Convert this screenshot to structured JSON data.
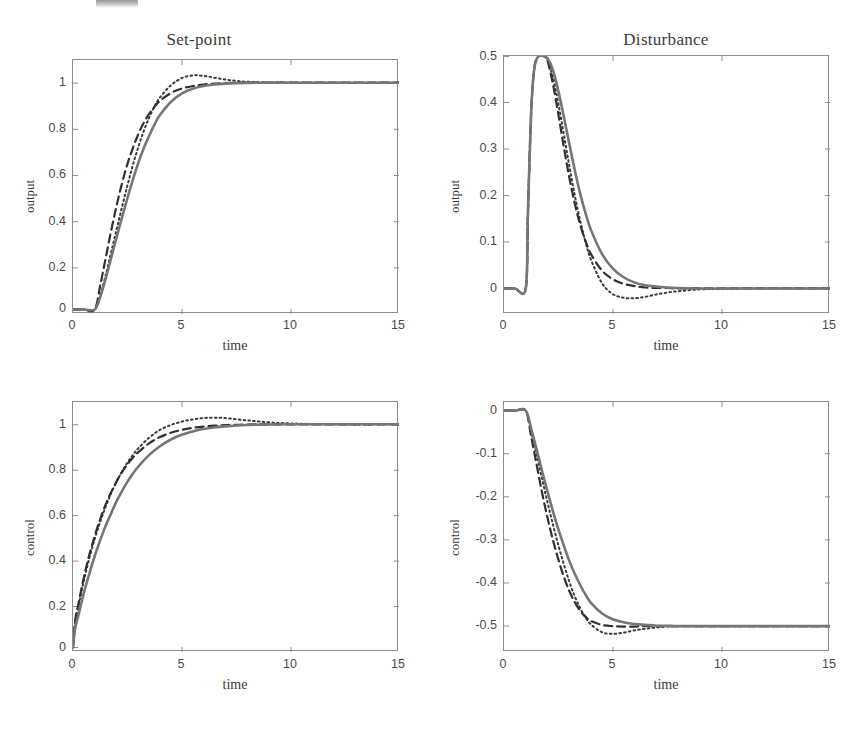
{
  "figure": {
    "background_color": "#ffffff",
    "line_color_solid": "#767676",
    "line_color_dashed": "#303030",
    "line_color_dotted": "#3a3a3a",
    "axis_color": "#8d8d8d"
  },
  "panels": [
    {
      "id": "setpoint-output",
      "title": "Set-point",
      "xlabel": "time",
      "ylabel": "output",
      "xticks": [
        "0",
        "5",
        "10",
        "15"
      ],
      "yticks": [
        "0",
        "0.2",
        "0.4",
        "0.6",
        "0.8",
        "1"
      ]
    },
    {
      "id": "disturbance-output",
      "title": "Disturbance",
      "xlabel": "time",
      "ylabel": "output",
      "xticks": [
        "0",
        "5",
        "10",
        "15"
      ],
      "yticks": [
        "0",
        "0.1",
        "0.2",
        "0.3",
        "0.4",
        "0.5"
      ]
    },
    {
      "id": "setpoint-control",
      "title": "",
      "xlabel": "time",
      "ylabel": "control",
      "xticks": [
        "0",
        "5",
        "10",
        "15"
      ],
      "yticks": [
        "0",
        "0.2",
        "0.4",
        "0.6",
        "0.8",
        "1"
      ]
    },
    {
      "id": "disturbance-control",
      "title": "",
      "xlabel": "time",
      "ylabel": "control",
      "xticks": [
        "0",
        "5",
        "10",
        "15"
      ],
      "yticks": [
        "-0.5",
        "-0.4",
        "-0.3",
        "-0.2",
        "-0.1",
        "0"
      ]
    }
  ],
  "chart_data": [
    {
      "type": "line",
      "id": "setpoint-output",
      "title": "Set-point",
      "xlabel": "time",
      "ylabel": "output",
      "xlim": [
        0,
        15
      ],
      "ylim": [
        -0.02,
        1.1
      ],
      "xticks": [
        0,
        5,
        10,
        15
      ],
      "yticks": [
        0,
        0.2,
        0.4,
        0.6,
        0.8,
        1
      ],
      "grid": false,
      "legend": "none",
      "x": [
        0,
        0.5,
        1,
        1.25,
        1.5,
        1.75,
        2,
        2.25,
        2.5,
        2.75,
        3,
        3.25,
        3.5,
        3.75,
        4,
        4.5,
        5,
        5.5,
        6,
        6.5,
        7,
        7.5,
        8,
        9,
        10,
        11,
        12,
        13,
        14,
        15
      ],
      "series": [
        {
          "name": "solid",
          "style": "solid",
          "color": "#767676",
          "values": [
            0,
            0,
            0,
            0.055,
            0.135,
            0.225,
            0.315,
            0.405,
            0.49,
            0.57,
            0.645,
            0.71,
            0.765,
            0.815,
            0.857,
            0.915,
            0.952,
            0.973,
            0.985,
            0.992,
            0.996,
            0.998,
            0.999,
            1,
            1,
            1,
            1,
            1,
            1,
            1
          ]
        },
        {
          "name": "dashed",
          "style": "dashed",
          "color": "#303030",
          "values": [
            0,
            0,
            0,
            0.105,
            0.225,
            0.345,
            0.455,
            0.555,
            0.64,
            0.71,
            0.772,
            0.822,
            0.862,
            0.894,
            0.92,
            0.954,
            0.974,
            0.985,
            0.992,
            0.996,
            0.998,
            0.999,
            1,
            1,
            1,
            1,
            1,
            1,
            1,
            1
          ]
        },
        {
          "name": "dotted",
          "style": "dotted",
          "color": "#3a3a3a",
          "values": [
            0,
            0,
            0,
            0.06,
            0.15,
            0.25,
            0.35,
            0.45,
            0.545,
            0.635,
            0.715,
            0.785,
            0.845,
            0.895,
            0.935,
            0.988,
            1.02,
            1.032,
            1.03,
            1.022,
            1.014,
            1.008,
            1.004,
            1.001,
            1,
            1,
            1,
            1,
            1,
            1
          ]
        }
      ]
    },
    {
      "type": "line",
      "id": "disturbance-output",
      "title": "Disturbance",
      "xlabel": "time",
      "ylabel": "output",
      "xlim": [
        0,
        15
      ],
      "ylim": [
        -0.055,
        0.5
      ],
      "xticks": [
        0,
        5,
        10,
        15
      ],
      "yticks": [
        0,
        0.1,
        0.2,
        0.3,
        0.4,
        0.5
      ],
      "grid": false,
      "legend": "none",
      "x": [
        0,
        0.5,
        1,
        1.1,
        1.25,
        1.4,
        1.6,
        1.8,
        2,
        2.25,
        2.5,
        2.75,
        3,
        3.25,
        3.5,
        3.75,
        4,
        4.5,
        5,
        5.5,
        6,
        6.5,
        7,
        7.5,
        8,
        9,
        10,
        12,
        15
      ],
      "series": [
        {
          "name": "solid",
          "style": "solid",
          "color": "#767676",
          "values": [
            0,
            0,
            0,
            0.16,
            0.38,
            0.475,
            0.5,
            0.5,
            0.495,
            0.47,
            0.425,
            0.37,
            0.312,
            0.256,
            0.205,
            0.162,
            0.126,
            0.075,
            0.043,
            0.024,
            0.013,
            0.007,
            0.004,
            0.002,
            0.001,
            0,
            0,
            0,
            0
          ]
        },
        {
          "name": "dashed",
          "style": "dashed",
          "color": "#303030",
          "values": [
            0,
            0,
            0,
            0.16,
            0.38,
            0.475,
            0.5,
            0.5,
            0.49,
            0.44,
            0.375,
            0.305,
            0.24,
            0.184,
            0.138,
            0.102,
            0.074,
            0.039,
            0.02,
            0.01,
            0.005,
            0.002,
            0.001,
            0.001,
            0,
            0,
            0,
            0,
            0
          ]
        },
        {
          "name": "dotted",
          "style": "dotted",
          "color": "#3a3a3a",
          "values": [
            0,
            0,
            0,
            0.16,
            0.38,
            0.475,
            0.5,
            0.5,
            0.492,
            0.455,
            0.398,
            0.332,
            0.265,
            0.202,
            0.147,
            0.1,
            0.062,
            0.012,
            -0.012,
            -0.02,
            -0.021,
            -0.018,
            -0.013,
            -0.009,
            -0.006,
            -0.002,
            -0.001,
            0,
            0
          ]
        }
      ]
    },
    {
      "type": "line",
      "id": "setpoint-control",
      "title": "",
      "xlabel": "time",
      "ylabel": "control",
      "xlim": [
        0,
        15
      ],
      "ylim": [
        -0.02,
        1.1
      ],
      "xticks": [
        0,
        5,
        10,
        15
      ],
      "yticks": [
        0,
        0.2,
        0.4,
        0.6,
        0.8,
        1
      ],
      "grid": false,
      "legend": "none",
      "x": [
        0,
        0.1,
        0.25,
        0.5,
        0.75,
        1,
        1.25,
        1.5,
        1.75,
        2,
        2.25,
        2.5,
        2.75,
        3,
        3.5,
        4,
        4.5,
        5,
        5.5,
        6,
        6.5,
        7,
        8,
        9,
        10,
        12,
        15
      ],
      "series": [
        {
          "name": "solid",
          "style": "solid",
          "color": "#767676",
          "values": [
            0,
            0.085,
            0.145,
            0.245,
            0.33,
            0.41,
            0.48,
            0.545,
            0.6,
            0.655,
            0.7,
            0.742,
            0.778,
            0.81,
            0.862,
            0.902,
            0.932,
            0.953,
            0.968,
            0.979,
            0.986,
            0.991,
            0.997,
            0.999,
            1,
            1,
            1
          ]
        },
        {
          "name": "dashed",
          "style": "dashed",
          "color": "#303030",
          "values": [
            0,
            0.12,
            0.195,
            0.315,
            0.415,
            0.5,
            0.575,
            0.64,
            0.695,
            0.743,
            0.785,
            0.82,
            0.85,
            0.875,
            0.915,
            0.943,
            0.962,
            0.975,
            0.984,
            0.99,
            0.994,
            0.996,
            0.999,
            1,
            1,
            1,
            1
          ]
        },
        {
          "name": "dotted",
          "style": "dotted",
          "color": "#3a3a3a",
          "values": [
            0,
            0.115,
            0.185,
            0.3,
            0.4,
            0.487,
            0.563,
            0.63,
            0.69,
            0.742,
            0.788,
            0.828,
            0.862,
            0.892,
            0.94,
            0.975,
            0.997,
            1.012,
            1.022,
            1.028,
            1.03,
            1.028,
            1.018,
            1.009,
            1.004,
            1,
            1
          ]
        }
      ]
    },
    {
      "type": "line",
      "id": "disturbance-control",
      "title": "",
      "xlabel": "time",
      "ylabel": "control",
      "xlim": [
        0,
        15
      ],
      "ylim": [
        -0.56,
        0.02
      ],
      "xticks": [
        0,
        5,
        10,
        15
      ],
      "yticks": [
        -0.5,
        -0.4,
        -0.3,
        -0.2,
        -0.1,
        0
      ],
      "grid": false,
      "legend": "none",
      "x": [
        0,
        0.5,
        1,
        1.25,
        1.5,
        1.75,
        2,
        2.25,
        2.5,
        2.75,
        3,
        3.25,
        3.5,
        3.75,
        4,
        4.5,
        5,
        5.5,
        6,
        6.5,
        7,
        7.5,
        8,
        9,
        10,
        12,
        15
      ],
      "series": [
        {
          "name": "solid",
          "style": "solid",
          "color": "#767676",
          "values": [
            0,
            0,
            0,
            -0.042,
            -0.09,
            -0.14,
            -0.188,
            -0.233,
            -0.275,
            -0.313,
            -0.348,
            -0.378,
            -0.404,
            -0.427,
            -0.446,
            -0.47,
            -0.484,
            -0.491,
            -0.495,
            -0.497,
            -0.499,
            -0.499,
            -0.5,
            -0.5,
            -0.5,
            -0.5,
            -0.5
          ]
        },
        {
          "name": "dashed",
          "style": "dashed",
          "color": "#303030",
          "values": [
            0,
            0,
            0,
            -0.06,
            -0.125,
            -0.19,
            -0.248,
            -0.3,
            -0.345,
            -0.385,
            -0.418,
            -0.444,
            -0.464,
            -0.478,
            -0.488,
            -0.497,
            -0.5,
            -0.501,
            -0.501,
            -0.5,
            -0.5,
            -0.5,
            -0.5,
            -0.5,
            -0.5,
            -0.5,
            -0.5
          ]
        },
        {
          "name": "dotted",
          "style": "dotted",
          "color": "#3a3a3a",
          "values": [
            0,
            0,
            0,
            -0.048,
            -0.102,
            -0.158,
            -0.212,
            -0.264,
            -0.312,
            -0.356,
            -0.396,
            -0.43,
            -0.458,
            -0.48,
            -0.496,
            -0.514,
            -0.518,
            -0.515,
            -0.51,
            -0.506,
            -0.503,
            -0.501,
            -0.5,
            -0.5,
            -0.5,
            -0.5,
            -0.5
          ]
        }
      ]
    }
  ]
}
